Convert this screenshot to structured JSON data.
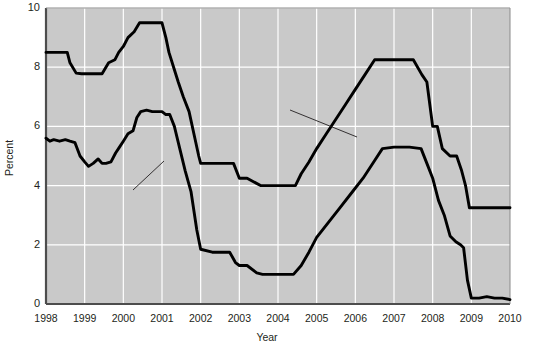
{
  "chart_data": {
    "type": "line",
    "title": "",
    "xlabel": "Year",
    "ylabel": "Percent",
    "xlim": [
      1998,
      2010
    ],
    "ylim": [
      0,
      10
    ],
    "grid": true,
    "legend_position": "inline-annotations",
    "x_ticks": [
      "1998",
      "1999",
      "2000",
      "2001",
      "2002",
      "2003",
      "2004",
      "2005",
      "2006",
      "2007",
      "2008",
      "2009",
      "2010"
    ],
    "y_ticks": [
      "0",
      "2",
      "4",
      "6",
      "8",
      "10"
    ],
    "plot_background": "#c9c9c9",
    "line_color": "#000000",
    "grid_color": "#ffffff",
    "annotations": [
      {
        "text": "Prime interest rate",
        "x": 2004.35,
        "y": 7.25
      },
      {
        "text": "Federal funds rate",
        "x": 1998.7,
        "y": 3.55
      }
    ],
    "series": [
      {
        "name": "Prime interest rate",
        "x": [
          1998.0,
          1998.3,
          1998.55,
          1998.62,
          1998.78,
          1998.92,
          1999.0,
          1999.45,
          1999.55,
          1999.62,
          1999.78,
          1999.88,
          2000.0,
          2000.12,
          2000.28,
          2000.42,
          2000.52,
          2000.62,
          2000.75,
          2001.0,
          2001.1,
          2001.18,
          2001.3,
          2001.42,
          2001.55,
          2001.7,
          2001.85,
          2001.95,
          2002.0,
          2002.2,
          2002.85,
          2003.0,
          2003.2,
          2003.55,
          2003.7,
          2004.0,
          2004.45,
          2004.6,
          2004.8,
          2005.0,
          2005.25,
          2005.5,
          2005.75,
          2006.0,
          2006.25,
          2006.5,
          2006.62,
          2007.0,
          2007.5,
          2007.72,
          2007.85,
          2008.0,
          2008.12,
          2008.25,
          2008.45,
          2008.62,
          2008.75,
          2008.85,
          2008.95,
          2009.0,
          2009.5,
          2010.0
        ],
        "y": [
          8.5,
          8.5,
          8.5,
          8.15,
          7.8,
          7.78,
          7.78,
          7.78,
          8.0,
          8.15,
          8.25,
          8.5,
          8.7,
          9.0,
          9.2,
          9.5,
          9.5,
          9.5,
          9.5,
          9.5,
          9.0,
          8.5,
          8.0,
          7.5,
          7.0,
          6.5,
          5.6,
          5.0,
          4.75,
          4.75,
          4.75,
          4.25,
          4.25,
          4.0,
          4.0,
          4.0,
          4.0,
          4.4,
          4.8,
          5.25,
          5.75,
          6.25,
          6.75,
          7.25,
          7.75,
          8.25,
          8.25,
          8.25,
          8.25,
          7.75,
          7.5,
          6.0,
          6.0,
          5.25,
          5.0,
          5.0,
          4.5,
          4.0,
          3.25,
          3.25,
          3.25,
          3.25
        ]
      },
      {
        "name": "Federal funds rate",
        "x": [
          1998.0,
          1998.1,
          1998.2,
          1998.35,
          1998.5,
          1998.62,
          1998.75,
          1998.88,
          1999.0,
          1999.1,
          1999.22,
          1999.35,
          1999.45,
          1999.55,
          1999.68,
          1999.8,
          1999.9,
          2000.0,
          2000.12,
          2000.25,
          2000.35,
          2000.45,
          2000.6,
          2000.75,
          2001.0,
          2001.1,
          2001.2,
          2001.32,
          2001.45,
          2001.6,
          2001.75,
          2001.9,
          2002.0,
          2002.3,
          2002.75,
          2002.9,
          2003.0,
          2003.2,
          2003.45,
          2003.6,
          2004.0,
          2004.4,
          2004.6,
          2004.8,
          2005.0,
          2005.3,
          2005.6,
          2005.9,
          2006.2,
          2006.5,
          2006.7,
          2007.0,
          2007.4,
          2007.7,
          2007.85,
          2008.0,
          2008.15,
          2008.3,
          2008.45,
          2008.6,
          2008.72,
          2008.8,
          2008.9,
          2009.0,
          2009.2,
          2009.4,
          2009.6,
          2009.8,
          2010.0
        ],
        "y": [
          5.6,
          5.5,
          5.55,
          5.5,
          5.55,
          5.5,
          5.45,
          5.0,
          4.8,
          4.65,
          4.75,
          4.9,
          4.75,
          4.75,
          4.8,
          5.1,
          5.3,
          5.5,
          5.75,
          5.85,
          6.3,
          6.5,
          6.55,
          6.5,
          6.5,
          6.4,
          6.4,
          6.0,
          5.3,
          4.5,
          3.8,
          2.5,
          1.85,
          1.75,
          1.75,
          1.4,
          1.3,
          1.3,
          1.05,
          1.0,
          1.0,
          1.0,
          1.3,
          1.75,
          2.25,
          2.75,
          3.25,
          3.75,
          4.25,
          4.85,
          5.25,
          5.3,
          5.3,
          5.25,
          4.75,
          4.25,
          3.5,
          3.0,
          2.3,
          2.1,
          2.0,
          1.9,
          0.8,
          0.2,
          0.2,
          0.25,
          0.2,
          0.2,
          0.15
        ]
      }
    ]
  },
  "axes": {
    "y_axis_title": "Percent",
    "x_axis_title": "Year"
  }
}
